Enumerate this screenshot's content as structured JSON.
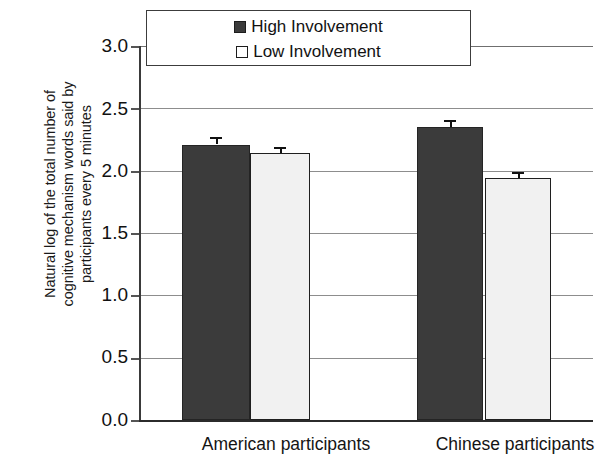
{
  "chart_data": {
    "type": "bar",
    "title": "",
    "subtitle": "",
    "xlabel": "",
    "ylabel": "Natural log of the total number of cognitive mechanism words said by participants every 5 minutes",
    "ylabel_lines": [
      "Natural log of the total number of",
      "cognitive mechanism words said by",
      "participants every 5 minutes"
    ],
    "categories": [
      "American participants",
      "Chinese participants"
    ],
    "series": [
      {
        "name": "High Involvement",
        "color": "#3b3b3b",
        "values": [
          2.21,
          2.35
        ],
        "errors": [
          0.06,
          0.06
        ]
      },
      {
        "name": "Low Involvement",
        "color": "#f1f1f1",
        "values": [
          2.14,
          1.94
        ],
        "errors": [
          0.05,
          0.05
        ]
      }
    ],
    "ylim": [
      0.0,
      3.0
    ],
    "ytick_values": [
      3.0,
      2.5,
      2.0,
      1.5,
      1.0,
      0.5,
      0.0
    ],
    "ytick_labels": [
      "3.0",
      "2.5",
      "2.0",
      "1.5",
      "1.0",
      "0.5",
      "0.0"
    ],
    "grid": true,
    "grid_axis": "y",
    "legend_position": "top-center",
    "error_bar_type": "standard-error"
  },
  "legend": {
    "entries": [
      {
        "label": "High Involvement",
        "marker": "filled-square-icon"
      },
      {
        "label": "Low Involvement",
        "marker": "open-square-icon"
      }
    ]
  },
  "axes": {
    "y_tick_labels": [
      "3.0",
      "2.5",
      "2.0",
      "1.5",
      "1.0",
      "0.5",
      "0.0"
    ],
    "x_category_labels": [
      "American participants",
      "Chinese participants"
    ]
  }
}
